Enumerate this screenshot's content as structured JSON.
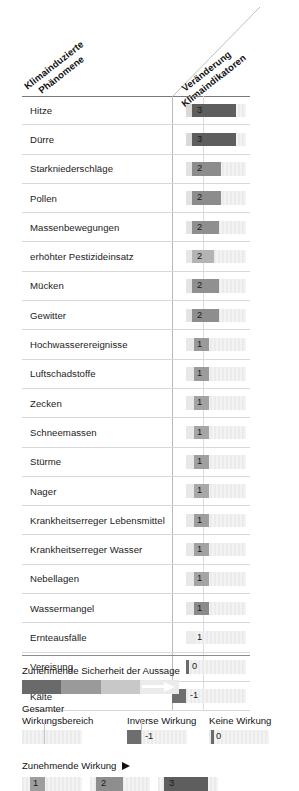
{
  "header": {
    "left_title_line1": "Klimainduzierte",
    "left_title_line2": "Phänomene",
    "right_title_line1": "Veränderung",
    "right_title_line2": "Klimaindikatoren"
  },
  "chart_data": {
    "type": "bar",
    "xlabel": "Veränderung Klimaindikatoren",
    "ylabel": "Klimainduzierte Phänomene",
    "grid": false,
    "legend_position": "bottom",
    "value_scale": [
      -1,
      0,
      1,
      2,
      3
    ],
    "categories": [
      "Hitze",
      "Dürre",
      "Starkniederschläge",
      "Pollen",
      "Massenbewegungen",
      "erhöhter Pestizideinsatz",
      "Mücken",
      "Gewitter",
      "Hochwasserereignisse",
      "Luftschadstoffe",
      "Zecken",
      "Schneemassen",
      "Stürme",
      "Nager",
      "Krankheitserreger Lebensmittel",
      "Krankheitserreger Wasser",
      "Nebellagen",
      "Wassermangel",
      "Ernteausfälle",
      "Vereisung",
      "Kälte"
    ],
    "values": [
      3,
      3,
      2,
      2,
      2,
      2,
      2,
      2,
      1,
      1,
      1,
      1,
      1,
      1,
      1,
      1,
      1,
      1,
      1,
      0,
      -1
    ]
  },
  "rows": [
    {
      "label": "Hitze",
      "value": "3",
      "start": 6,
      "width": 44,
      "fill": "#5e5e5e",
      "num_x": 11,
      "lead": "#d9d9d9",
      "lead_w": 6
    },
    {
      "label": "Dürre",
      "value": "3",
      "start": 6,
      "width": 44,
      "fill": "#5e5e5e",
      "num_x": 11,
      "lead": "#d9d9d9",
      "lead_w": 6
    },
    {
      "label": "Starkniederschläge",
      "value": "2",
      "start": 6,
      "width": 29,
      "fill": "#8c8c8c",
      "num_x": 11,
      "lead": "#e2e2e2",
      "lead_w": 6
    },
    {
      "label": "Pollen",
      "value": "2",
      "start": 6,
      "width": 29,
      "fill": "#8c8c8c",
      "num_x": 11,
      "lead": "#e2e2e2",
      "lead_w": 6
    },
    {
      "label": "Massenbewegungen",
      "value": "2",
      "start": 6,
      "width": 27,
      "fill": "#8f8f8f",
      "num_x": 11,
      "lead": "#e4e4e4",
      "lead_w": 6
    },
    {
      "label": "erhöhter Pestizideinsatz",
      "value": "2",
      "start": 6,
      "width": 22,
      "fill": "#b4b4b4",
      "num_x": 11,
      "lead": "#e6e6e6",
      "lead_w": 6
    },
    {
      "label": "Mücken",
      "value": "2",
      "start": 6,
      "width": 27,
      "fill": "#909090",
      "num_x": 11,
      "lead": "#e4e4e4",
      "lead_w": 6
    },
    {
      "label": "Gewitter",
      "value": "2",
      "start": 6,
      "width": 27,
      "fill": "#8e8e8e",
      "num_x": 11,
      "lead": "#e4e4e4",
      "lead_w": 6
    },
    {
      "label": "Hochwasserereignisse",
      "value": "1",
      "start": 8,
      "width": 15,
      "fill": "#9a9a9a",
      "num_x": 11,
      "lead": "#e8e8e8",
      "lead_w": 8
    },
    {
      "label": "Luftschadstoffe",
      "value": "1",
      "start": 8,
      "width": 15,
      "fill": "#9c9c9c",
      "num_x": 11,
      "lead": "#e8e8e8",
      "lead_w": 8
    },
    {
      "label": "Zecken",
      "value": "1",
      "start": 8,
      "width": 15,
      "fill": "#a3a3a3",
      "num_x": 11,
      "lead": "#e8e8e8",
      "lead_w": 8
    },
    {
      "label": "Schneemassen",
      "value": "1",
      "start": 8,
      "width": 15,
      "fill": "#a6a6a6",
      "num_x": 11,
      "lead": "#e8e8e8",
      "lead_w": 8
    },
    {
      "label": "Stürme",
      "value": "1",
      "start": 8,
      "width": 15,
      "fill": "#a0a0a0",
      "num_x": 11,
      "lead": "#e8e8e8",
      "lead_w": 8
    },
    {
      "label": "Nager",
      "value": "1",
      "start": 8,
      "width": 15,
      "fill": "#a8a8a8",
      "num_x": 11,
      "lead": "#e8e8e8",
      "lead_w": 8
    },
    {
      "label": "Krankheitserreger Lebensmittel",
      "value": "1",
      "start": 8,
      "width": 15,
      "fill": "#9e9e9e",
      "num_x": 11,
      "lead": "#e8e8e8",
      "lead_w": 8
    },
    {
      "label": "Krankheitserreger Wasser",
      "value": "1",
      "start": 8,
      "width": 15,
      "fill": "#a2a2a2",
      "num_x": 11,
      "lead": "#e8e8e8",
      "lead_w": 8
    },
    {
      "label": "Nebellagen",
      "value": "1",
      "start": 8,
      "width": 15,
      "fill": "#a4a4a4",
      "num_x": 11,
      "lead": "#e8e8e8",
      "lead_w": 8
    },
    {
      "label": "Wassermangel",
      "value": "1",
      "start": 8,
      "width": 15,
      "fill": "#8a8a8a",
      "num_x": 11,
      "lead": "#e6e6e6",
      "lead_w": 8
    },
    {
      "label": "Ernteausfälle",
      "value": "1",
      "start": 8,
      "width": 0,
      "fill": "#e0e0e0",
      "num_x": 11,
      "lead": "#ececec",
      "lead_w": 8
    },
    {
      "label": "Vereisung",
      "value": "0",
      "start": 0,
      "width": 2.5,
      "fill": "#6a6a6a",
      "num_x": 6,
      "lead": "#ffffff",
      "lead_w": 0
    },
    {
      "label": "Kälte",
      "value": "-1",
      "start": -14,
      "width": 14,
      "fill": "#6e6e6e",
      "num_x": 4,
      "lead": "#ffffff",
      "lead_w": 0
    }
  ],
  "legend": {
    "confidence_title": "Zunehmende Sicherheit der Aussage",
    "confidence_segments": [
      "#ebebeb",
      "#c8c8c8",
      "#9a9a9a",
      "#6a6a6a"
    ],
    "range_title_line1": "Gesamter",
    "range_title_line2": "Wirkungsbereich",
    "inverse_title": "Inverse Wirkung",
    "inverse_value": "-1",
    "none_title": "Keine Wirkung",
    "none_value": "0",
    "increasing_title": "Zunehmende Wirkung",
    "swatches": [
      {
        "value": "1",
        "width": 15,
        "fill": "#9e9e9e",
        "track_w": 60,
        "start": 8,
        "num_x": 11
      },
      {
        "value": "2",
        "width": 27,
        "fill": "#8e8e8e",
        "track_w": 60,
        "start": 6,
        "num_x": 11
      },
      {
        "value": "3",
        "width": 44,
        "fill": "#5e5e5e",
        "track_w": 60,
        "start": 6,
        "num_x": 11
      }
    ]
  }
}
